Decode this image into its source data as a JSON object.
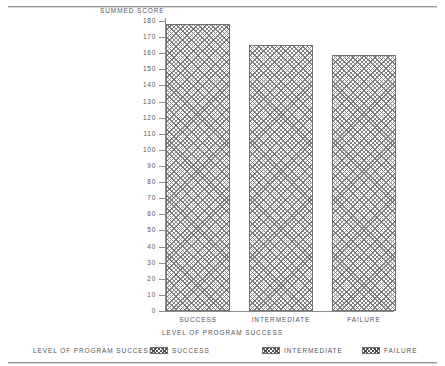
{
  "chart_data": {
    "type": "bar",
    "title": "",
    "ylabel": "SUMMED SCORE",
    "xlabel": "LEVEL OF PROGRAM SUCCESS",
    "categories": [
      "SUCCESS",
      "INTERMEDIATE",
      "FAILURE"
    ],
    "values": [
      178,
      165,
      159
    ],
    "ylim": [
      0,
      180
    ],
    "ytick_step": 10,
    "yticks": [
      180,
      170,
      160,
      150,
      140,
      130,
      120,
      110,
      100,
      90,
      80,
      70,
      60,
      50,
      40,
      30,
      20,
      10,
      0
    ],
    "ytick_labels": [
      "180",
      "170",
      "160",
      "150",
      "140",
      "130",
      "120",
      "110",
      "100",
      "90",
      "80",
      "70",
      "60",
      "50",
      "40",
      "30",
      "20",
      "10",
      "0"
    ],
    "grid": false,
    "legend_position": "bottom",
    "series": [
      {
        "name": "SUMMED SCORE",
        "values": [
          178,
          165,
          159
        ]
      }
    ],
    "bar_fill": "crosshatch",
    "bar_edge_color": "#6f6f6f",
    "text_color": "#555555"
  },
  "legend": {
    "title": "LEVEL OF PROGRAM SUCCESS",
    "entries": [
      {
        "label": "SUCCESS"
      },
      {
        "label": "INTERMEDIATE"
      },
      {
        "label": "FAILURE"
      }
    ]
  }
}
